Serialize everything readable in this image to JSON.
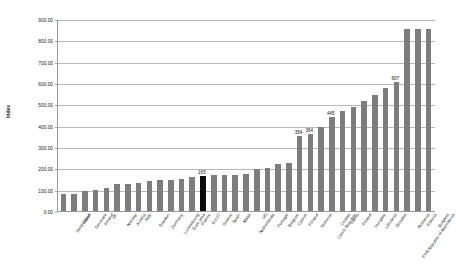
{
  "chart_data": {
    "type": "bar",
    "title": "",
    "subtitle": "",
    "xlabel": "",
    "ylabel": "Index",
    "ylim": [
      0,
      900
    ],
    "ytick_step": 100,
    "ytick_labels": [
      "0.00",
      "100.00",
      "200.00",
      "300.00",
      "400.00",
      "500.00",
      "600.00",
      "700.00",
      "800.00",
      "900.00"
    ],
    "grid": true,
    "legend": "none",
    "bar_color": "#7d7d7d",
    "highlight_color": "#0d0d0d",
    "highlight_category": "EU-27",
    "categories": [
      "Switzerland",
      "Japan",
      "Denmark",
      "Ireland",
      "UK",
      "Norway",
      "Austria",
      "Italy",
      "Sweden",
      "Germany",
      "Luxembourg",
      "Euro area",
      "France",
      "EU-27",
      "Greece",
      "Spain",
      "Malta",
      "Netherlands",
      "US",
      "Portugal",
      "Belgium",
      "Cyprus",
      "Finland",
      "Slovenia",
      "Czech Republic",
      "Croatia",
      "Latvia",
      "Poland",
      "Hungary",
      "Lithuania",
      "Slovakia",
      "FYR Republic of Macedonia",
      "Romania",
      "Estonia",
      "Bulgaria"
    ],
    "values": [
      78,
      82,
      96,
      101,
      107,
      126,
      128,
      132,
      140,
      145,
      148,
      152,
      158,
      165,
      172,
      172,
      172,
      176,
      196,
      205,
      222,
      228,
      354,
      364,
      395,
      445,
      470,
      490,
      520,
      548,
      580,
      607,
      860,
      860,
      860
    ],
    "labeled_points": [
      {
        "category": "EU-27",
        "value": 165,
        "label": "165"
      },
      {
        "category": "Finland",
        "value": 354,
        "label": "354"
      },
      {
        "category": "Slovenia",
        "value": 364,
        "label": "364"
      },
      {
        "category": "Croatia",
        "value": 445,
        "label": "445"
      },
      {
        "category": "FYR Republic of Macedonia",
        "value": 607,
        "label": "607"
      }
    ]
  },
  "axis": {
    "y_title": "Index"
  }
}
